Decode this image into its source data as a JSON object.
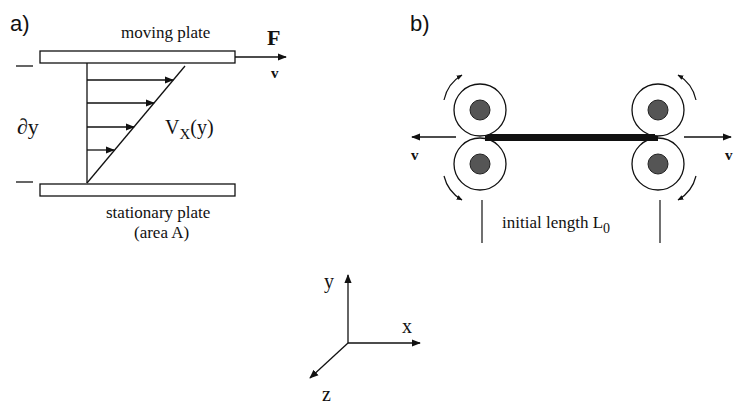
{
  "panel_a": {
    "label": "a)",
    "top_plate_label": "moving plate",
    "bottom_plate_label": "stationary plate",
    "bottom_plate_sublabel": "(area A)",
    "force_label": "F",
    "velocity_label": "v",
    "gap_label": "∂y",
    "profile_label_main": "V",
    "profile_label_sub": "X",
    "profile_label_arg": "(y)"
  },
  "panel_b": {
    "label": "b)",
    "left_velocity_label": "v",
    "right_velocity_label": "v",
    "length_label": "initial length L",
    "length_label_sub": "0"
  },
  "axes": {
    "x_label": "x",
    "y_label": "y",
    "z_label": "z"
  },
  "colors": {
    "stroke": "#111111",
    "roller_dot": "#555555",
    "background": "#ffffff"
  }
}
